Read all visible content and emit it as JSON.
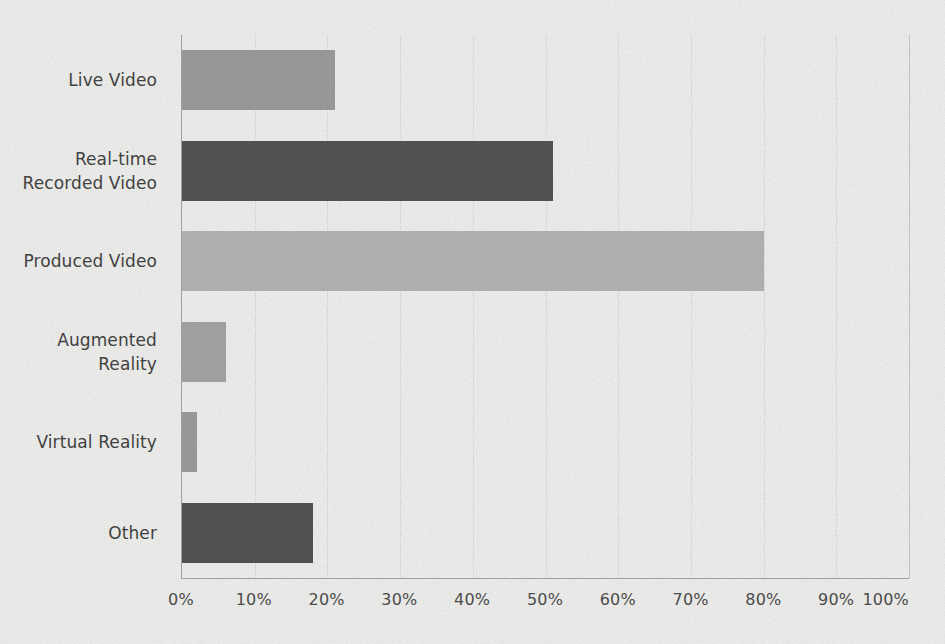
{
  "page": {
    "background": "#fbfbf9"
  },
  "chart_data": {
    "type": "bar",
    "orientation": "horizontal",
    "title": "",
    "xlabel": "",
    "ylabel": "",
    "categories": [
      "Live Video",
      "Real-time Recorded Video",
      "Produced Video",
      "Augmented Reality",
      "Virtual Reality",
      "Other"
    ],
    "values": [
      21,
      51,
      80,
      6,
      2,
      18
    ],
    "unit": "%",
    "xlim": [
      0,
      100
    ],
    "x_ticks": [
      "0%",
      "10%",
      "20%",
      "30%",
      "40%",
      "50%",
      "60%",
      "70%",
      "80%",
      "90%",
      "100%"
    ],
    "grid": "vertical-dotted",
    "legend": "none",
    "bar_colors": [
      "#9e9e9e",
      "#4d4d4d",
      "#b9b9b9",
      "#a8a8a8",
      "#9e9e9e",
      "#4d4d4d"
    ],
    "axis_color": "#a9a9a9",
    "gridline_color": "#dcdcdc",
    "plot_right_edge_color": "#cfcfcf",
    "category_label_color": "#3a3a3a",
    "tick_label_color": "#474747"
  }
}
